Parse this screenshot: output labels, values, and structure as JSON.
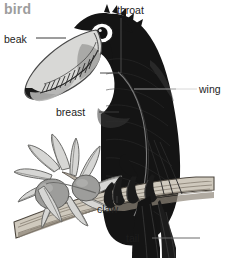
{
  "figure": {
    "title": "bird",
    "style": "grayscale line illustration",
    "background_color": "#ffffff",
    "title_color": "#9d9d9d",
    "label_color": "#1d1d1d",
    "leader_color": "#3a3a3a",
    "width": 227,
    "height": 258
  },
  "labels": [
    {
      "id": "beak",
      "text": "beak",
      "x": 4,
      "y": 33,
      "anchor": "left"
    },
    {
      "id": "throat",
      "text": "throat",
      "x": 117,
      "y": 4,
      "anchor": "top"
    },
    {
      "id": "wing",
      "text": "wing",
      "x": 199,
      "y": 83,
      "anchor": "right"
    },
    {
      "id": "breast",
      "text": "breast",
      "x": 56,
      "y": 106,
      "anchor": "left"
    },
    {
      "id": "claw",
      "text": "claw",
      "x": 97,
      "y": 203,
      "anchor": "bottom"
    },
    {
      "id": "tail",
      "text": "tail",
      "x": 126,
      "y": 232,
      "anchor": "left"
    }
  ],
  "palette": {
    "black_plumage": "#141414",
    "black_plumage_shade": "#2b2b2b",
    "beak_light": "#d8d8d6",
    "beak_mid": "#b9b9b6",
    "beak_dark": "#1a1a1a",
    "eye_white": "#ffffff",
    "eye_pupil": "#101010",
    "branch_light": "#cfc9bd",
    "branch_mid": "#a9a296",
    "branch_outline": "#5a5248",
    "leaf_light": "#d6d6d4",
    "leaf_outline": "#6e6e6c",
    "fruit_gray": "#9d9d9b"
  }
}
